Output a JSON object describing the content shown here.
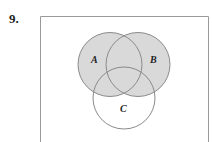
{
  "problem": {
    "number": "9."
  },
  "diagram": {
    "type": "venn",
    "universe_box": {
      "left": 40,
      "top": 16,
      "right": 208,
      "bottom_open": true
    },
    "sets": [
      {
        "id": "A",
        "label": "A",
        "cx": 110,
        "cy": 64.5,
        "r": 32,
        "shaded": true
      },
      {
        "id": "B",
        "label": "B",
        "cx": 138,
        "cy": 64.5,
        "r": 32,
        "shaded": true
      },
      {
        "id": "C",
        "label": "C",
        "cx": 124,
        "cy": 98,
        "r": 31,
        "shaded": false
      }
    ],
    "shaded_region": "A ∪ B",
    "colors": {
      "fill": "#d9d9d9",
      "stroke": "#8a8a8a",
      "box_stroke": "#9a9a9a",
      "background": "#ffffff"
    }
  }
}
